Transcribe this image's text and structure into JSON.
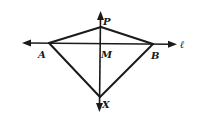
{
  "diagram": {
    "type": "geometry",
    "points": {
      "A": {
        "label": "A",
        "x": 49,
        "y": 43
      },
      "B": {
        "label": "B",
        "x": 153,
        "y": 44
      },
      "P": {
        "label": "P",
        "x": 101,
        "y": 27
      },
      "M": {
        "label": "M",
        "x": 100,
        "y": 43.5
      },
      "X": {
        "label": "X",
        "x": 100,
        "y": 97
      }
    },
    "line_label": "ℓ",
    "labels": {
      "A": "A",
      "B": "B",
      "P": "P",
      "M": "M",
      "X": "X",
      "l": "ℓ"
    },
    "colors": {
      "stroke": "#1a1a1a",
      "background": "#ffffff"
    }
  }
}
